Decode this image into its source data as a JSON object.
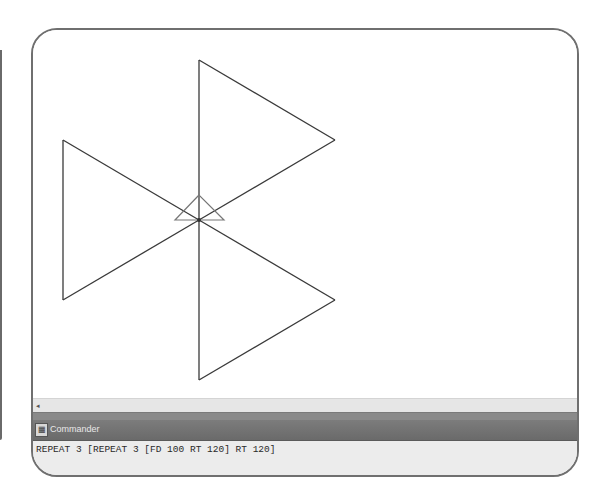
{
  "canvas": {
    "stroke_color": "#3a3a3a",
    "turtle_color": "#777777",
    "shape_lines": [
      [
        166,
        30,
        166,
        190
      ],
      [
        166,
        30,
        302,
        110
      ],
      [
        302,
        110,
        166,
        190
      ],
      [
        166,
        190,
        30,
        110
      ],
      [
        30,
        110,
        30,
        270
      ],
      [
        30,
        270,
        166,
        190
      ],
      [
        166,
        190,
        302,
        270
      ],
      [
        302,
        270,
        166,
        350
      ],
      [
        166,
        350,
        166,
        190
      ]
    ],
    "turtle_points": "166,165 142,190 191,190"
  },
  "scrollbar": {
    "left_arrow": "◂"
  },
  "commander": {
    "title": "Commander",
    "icon": "commander-window-icon",
    "command_text": "REPEAT 3 [REPEAT 3 [FD 100 RT 120] RT 120]"
  }
}
